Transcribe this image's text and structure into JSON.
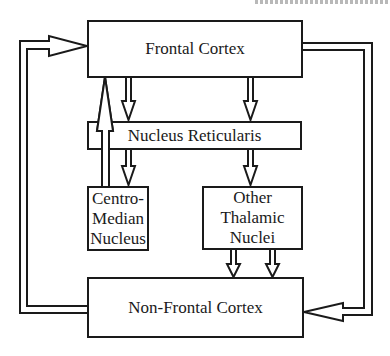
{
  "diagram": {
    "boxes": {
      "frontal_cortex": {
        "label": "Frontal Cortex"
      },
      "nucleus_reticularis": {
        "label": "Nucleus Reticularis"
      },
      "centro_median": {
        "label": "Centro-\nMedian\nNucleus"
      },
      "other_thalamic": {
        "label": "Other\nThalamic\nNuclei"
      },
      "non_frontal_cortex": {
        "label": "Non-Frontal Cortex"
      }
    },
    "connections": [
      {
        "from": "Frontal Cortex",
        "to": "Nucleus Reticularis",
        "count": 2
      },
      {
        "from": "Nucleus Reticularis",
        "to": "Centro-Median Nucleus",
        "count": 1
      },
      {
        "from": "Nucleus Reticularis",
        "to": "Other Thalamic Nuclei",
        "count": 1
      },
      {
        "from": "Centro-Median Nucleus",
        "to": "Frontal Cortex",
        "count": 1
      },
      {
        "from": "Other Thalamic Nuclei",
        "to": "Non-Frontal Cortex",
        "count": 2
      },
      {
        "from": "Non-Frontal Cortex",
        "to": "Frontal Cortex",
        "count": 1
      },
      {
        "from": "Frontal Cortex",
        "to": "Non-Frontal Cortex",
        "count": 1
      }
    ],
    "colors": {
      "stroke": "#1a1a1a",
      "background": "#ffffff"
    }
  }
}
